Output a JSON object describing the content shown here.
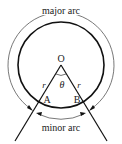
{
  "diagram": {
    "labels": {
      "major_arc": "major arc",
      "minor_arc": "minor arc",
      "center": "O",
      "point_a": "A",
      "point_b": "B",
      "radius_left": "r",
      "radius_right": "r",
      "angle": "θ"
    },
    "colors": {
      "stroke": "#111111",
      "arc_stroke": "#555555",
      "background": "#ffffff"
    }
  }
}
